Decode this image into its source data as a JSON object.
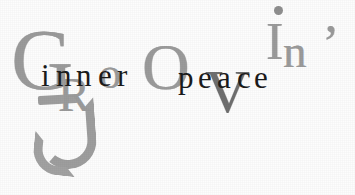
{
  "artwork": {
    "type": "typographic-logo",
    "background_color": "#fdfdfd",
    "primary_word": "Groovin'",
    "overlay_phrase": "inner peace",
    "big_letter_color": "#9b9b9b",
    "accent_letter_color": "#6f6f6f",
    "small_letter_color": "#1b1b1b"
  },
  "groovin": {
    "letters": {
      "G": "G",
      "R": "R",
      "o": "o",
      "O": "O",
      "V": "V",
      "I": "I",
      "n": "n",
      "apostrophe": "’"
    }
  },
  "inner_peace": {
    "word1": {
      "i": "i",
      "n1": "n",
      "n2": "n",
      "e": "e",
      "r": "r"
    },
    "word2": {
      "p": "p",
      "e1": "e",
      "a": "a",
      "c": "c",
      "e2": "e"
    }
  }
}
